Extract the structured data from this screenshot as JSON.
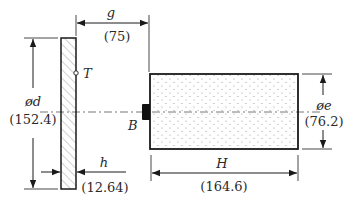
{
  "diagram": {
    "plate": {
      "marker_label": "T"
    },
    "target": {
      "block_label": "B"
    },
    "dimensions": {
      "g": {
        "symbol": "g",
        "value": "(75)"
      },
      "d": {
        "symbol": "ød",
        "value": "(152.4)"
      },
      "h": {
        "symbol": "h",
        "value": "(12.64)"
      },
      "H": {
        "symbol": "H",
        "value": "(164.6)"
      },
      "e": {
        "symbol": "øe",
        "value": "(76.2)"
      }
    },
    "colors": {
      "line": "#1a1a1a",
      "hatch": "#8a8a8a",
      "dots": "#9a9a9a",
      "block": "#111111"
    }
  }
}
